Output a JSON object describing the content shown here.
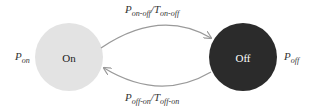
{
  "diagram": {
    "type": "state-transition",
    "states": [
      {
        "id": "on",
        "label": "On",
        "side_label_main": "P",
        "side_label_sub": "on",
        "fill": "#e3e3e3",
        "text_color": "#222222"
      },
      {
        "id": "off",
        "label": "Off",
        "side_label_main": "P",
        "side_label_sub": "off",
        "fill": "#2b2b2b",
        "text_color": "#ffffff"
      }
    ],
    "transitions": [
      {
        "from": "on",
        "to": "off",
        "label_p": "P",
        "label_p_sub": "on-off",
        "sep": "/",
        "label_t": "T",
        "label_t_sub": "on-off"
      },
      {
        "from": "off",
        "to": "on",
        "label_p": "P",
        "label_p_sub": "off-on",
        "sep": "/",
        "label_t": "T",
        "label_t_sub": "off-on"
      }
    ],
    "arrow_color": "#9a9a9a"
  }
}
